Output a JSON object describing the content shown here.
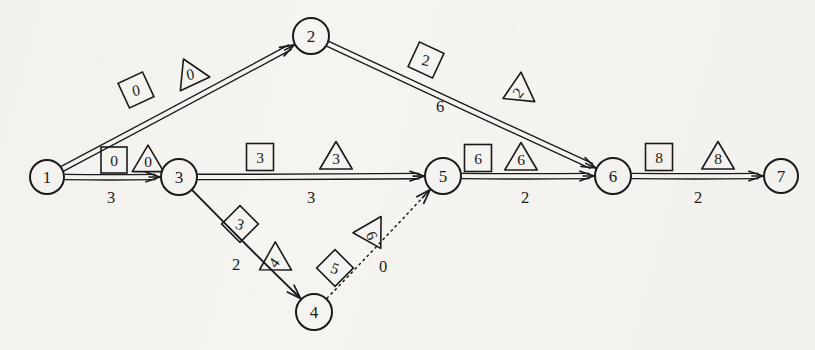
{
  "diagram": {
    "type": "activity-network-cpm",
    "title": "",
    "background_color": "#f6f4f0",
    "ink_color": "#1a1a1a",
    "nodes": [
      {
        "id": "1",
        "label": "1",
        "x": 47,
        "y": 177,
        "r": 17
      },
      {
        "id": "2",
        "label": "2",
        "x": 311,
        "y": 36,
        "r": 18
      },
      {
        "id": "3",
        "label": "3",
        "x": 179,
        "y": 177,
        "r": 18
      },
      {
        "id": "4",
        "label": "4",
        "x": 314,
        "y": 312,
        "r": 18
      },
      {
        "id": "5",
        "label": "5",
        "x": 443,
        "y": 176,
        "r": 18
      },
      {
        "id": "6",
        "label": "6",
        "x": 613,
        "y": 176,
        "r": 18
      },
      {
        "id": "7",
        "label": "7",
        "x": 781,
        "y": 176,
        "r": 17
      }
    ],
    "edges": [
      {
        "id": "e12",
        "from": "1",
        "to": "2",
        "style": "double-solid",
        "weight": "",
        "weight_x": 0,
        "weight_y": 0
      },
      {
        "id": "e13",
        "from": "1",
        "to": "3",
        "style": "double-solid",
        "weight": "3",
        "weight_x": 111,
        "weight_y": 203
      },
      {
        "id": "e26",
        "from": "2",
        "to": "6",
        "style": "double-solid",
        "weight": "6",
        "weight_x": 440,
        "weight_y": 112
      },
      {
        "id": "e35",
        "from": "3",
        "to": "5",
        "style": "double-solid",
        "weight": "3",
        "weight_x": 311,
        "weight_y": 203
      },
      {
        "id": "e34",
        "from": "3",
        "to": "4",
        "style": "single-solid",
        "weight": "2",
        "weight_x": 236,
        "weight_y": 270
      },
      {
        "id": "e45",
        "from": "4",
        "to": "5",
        "style": "dotted",
        "weight": "0",
        "weight_x": 383,
        "weight_y": 272
      },
      {
        "id": "e56",
        "from": "5",
        "to": "6",
        "style": "double-solid",
        "weight": "2",
        "weight_x": 525,
        "weight_y": 203
      },
      {
        "id": "e67",
        "from": "6",
        "to": "7",
        "style": "double-solid",
        "weight": "2",
        "weight_x": 698,
        "weight_y": 203
      }
    ],
    "labels": [
      {
        "id": "l-12-sq",
        "shape": "square",
        "value": "0",
        "x": 136,
        "y": 90,
        "rotate": -25,
        "size": 27,
        "edge": "e12"
      },
      {
        "id": "l-12-tri",
        "shape": "triangle",
        "value": "0",
        "x": 190,
        "y": 73,
        "rotate": -25,
        "size": 29,
        "edge": "e12"
      },
      {
        "id": "l-13-sq",
        "shape": "square",
        "value": "0",
        "x": 114,
        "y": 160,
        "rotate": 0,
        "size": 26,
        "edge": "e13"
      },
      {
        "id": "l-13-tri",
        "shape": "triangle",
        "value": "0",
        "x": 148,
        "y": 160,
        "rotate": 0,
        "size": 28,
        "edge": "e13"
      },
      {
        "id": "l-26-sq",
        "shape": "square",
        "value": "2",
        "x": 426,
        "y": 60,
        "rotate": 25,
        "size": 27,
        "edge": "e26"
      },
      {
        "id": "l-26-tri",
        "shape": "triangle",
        "value": "2",
        "x": 517,
        "y": 92,
        "rotate": -115,
        "size": 29,
        "edge": "e26"
      },
      {
        "id": "l-35-sq",
        "shape": "square",
        "value": "3",
        "x": 260,
        "y": 157,
        "rotate": 0,
        "size": 27,
        "edge": "e35"
      },
      {
        "id": "l-35-tri",
        "shape": "triangle",
        "value": "3",
        "x": 336,
        "y": 157,
        "rotate": 0,
        "size": 29,
        "edge": "e35"
      },
      {
        "id": "l-34-dia",
        "shape": "square",
        "value": "3",
        "x": 240,
        "y": 224,
        "rotate": 45,
        "size": 26,
        "edge": "e34"
      },
      {
        "id": "l-34-tri",
        "shape": "triangle",
        "value": "4",
        "x": 273,
        "y": 262,
        "rotate": -120,
        "size": 29,
        "edge": "e34"
      },
      {
        "id": "l-45-dia",
        "shape": "square",
        "value": "5",
        "x": 335,
        "y": 268,
        "rotate": 45,
        "size": 26,
        "edge": "e45"
      },
      {
        "id": "l-45-tri",
        "shape": "triangle",
        "value": "6",
        "x": 373,
        "y": 235,
        "rotate": 150,
        "size": 29,
        "edge": "e45"
      },
      {
        "id": "l-56-sq",
        "shape": "square",
        "value": "6",
        "x": 478,
        "y": 158,
        "rotate": 0,
        "size": 27,
        "edge": "e56"
      },
      {
        "id": "l-56-tri",
        "shape": "triangle",
        "value": "6",
        "x": 521,
        "y": 158,
        "rotate": 0,
        "size": 29,
        "edge": "e56"
      },
      {
        "id": "l-67-sq",
        "shape": "square",
        "value": "8",
        "x": 659,
        "y": 157,
        "rotate": 0,
        "size": 27,
        "edge": "e67"
      },
      {
        "id": "l-67-tri",
        "shape": "triangle",
        "value": "8",
        "x": 718,
        "y": 157,
        "rotate": 0,
        "size": 29,
        "edge": "e67"
      }
    ]
  },
  "chart_data": {
    "type": "diagram",
    "nodes": [
      "1",
      "2",
      "3",
      "4",
      "5",
      "6",
      "7"
    ],
    "edges": [
      {
        "from": "1",
        "to": "2",
        "duration": null,
        "square": "0",
        "triangle": "0"
      },
      {
        "from": "1",
        "to": "3",
        "duration": 3,
        "square": "0",
        "triangle": "0"
      },
      {
        "from": "2",
        "to": "6",
        "duration": 6,
        "square": "2",
        "triangle": "2"
      },
      {
        "from": "3",
        "to": "5",
        "duration": 3,
        "square": "3",
        "triangle": "3"
      },
      {
        "from": "3",
        "to": "4",
        "duration": 2,
        "square": "3",
        "triangle": "4"
      },
      {
        "from": "4",
        "to": "5",
        "duration": 0,
        "square": "5",
        "triangle": "6",
        "dummy": true
      },
      {
        "from": "5",
        "to": "6",
        "duration": 2,
        "square": "6",
        "triangle": "6"
      },
      {
        "from": "6",
        "to": "7",
        "duration": 2,
        "square": "8",
        "triangle": "8"
      }
    ]
  }
}
